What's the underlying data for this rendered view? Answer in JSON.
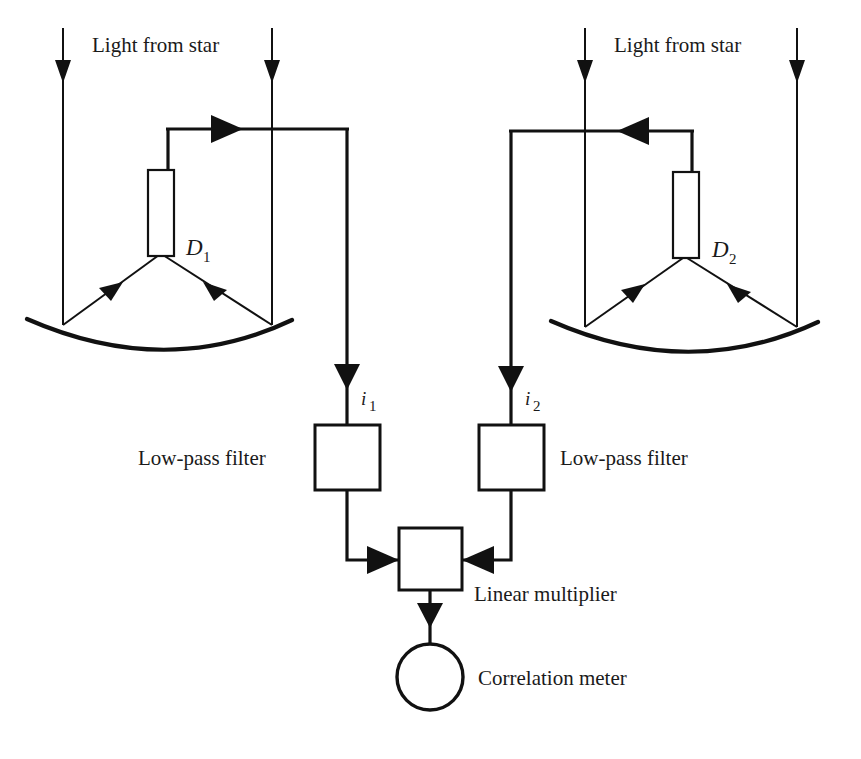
{
  "figure": {
    "width": 861,
    "height": 759,
    "background_color": "#ffffff",
    "ink_color": "#111111"
  },
  "labels": {
    "light_left": "Light from star",
    "light_right": "Light from star",
    "detector_left": "D",
    "detector_left_sub": "1",
    "detector_right": "D",
    "detector_right_sub": "2",
    "current_left": "i",
    "current_left_sub": "1",
    "current_right": "i",
    "current_right_sub": "2",
    "filter_left": "Low-pass filter",
    "filter_right": "Low-pass filter",
    "multiplier": "Linear multiplier",
    "meter": "Correlation meter"
  },
  "components": [
    {
      "id": "mirror-left",
      "name": "concave collecting mirror (left)",
      "shape": "arc"
    },
    {
      "id": "mirror-right",
      "name": "concave collecting mirror (right)",
      "shape": "arc"
    },
    {
      "id": "detector-left",
      "name": "photodetector D1",
      "shape": "rectangle"
    },
    {
      "id": "detector-right",
      "name": "photodetector D2",
      "shape": "rectangle"
    },
    {
      "id": "filter-left",
      "name": "low-pass filter 1",
      "shape": "square"
    },
    {
      "id": "filter-right",
      "name": "low-pass filter 2",
      "shape": "square"
    },
    {
      "id": "multiplier",
      "name": "linear multiplier",
      "shape": "square"
    },
    {
      "id": "meter",
      "name": "correlation meter",
      "shape": "circle"
    }
  ],
  "rays": {
    "incoming_count": 4,
    "direction": "downward",
    "note": "Starlight rays fall on each mirror and reflect up to the detector"
  }
}
